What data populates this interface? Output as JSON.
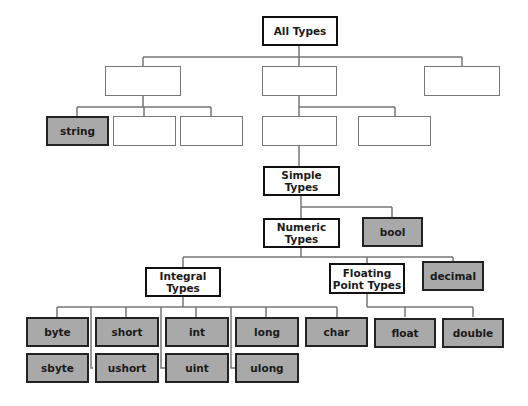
{
  "colors": {
    "value_type_fill": "#a9a9a9",
    "category_fill": "#ffffff",
    "line": "#777777"
  },
  "nodes": {
    "all_types": "All Types",
    "ref_a": "",
    "value_b": "",
    "ptr_c": "",
    "string": "string",
    "blank_1": "",
    "blank_2": "",
    "blank_3": "",
    "blank_4": "",
    "simple_types": "Simple Types",
    "numeric_types": "Numeric Types",
    "bool": "bool",
    "integral_types": "Integral Types",
    "floating_point_types": "Floating Point Types",
    "decimal": "decimal",
    "byte": "byte",
    "sbyte": "sbyte",
    "short": "short",
    "ushort": "ushort",
    "int": "int",
    "uint": "uint",
    "long": "long",
    "ulong": "ulong",
    "char": "char",
    "float": "float",
    "double": "double"
  }
}
